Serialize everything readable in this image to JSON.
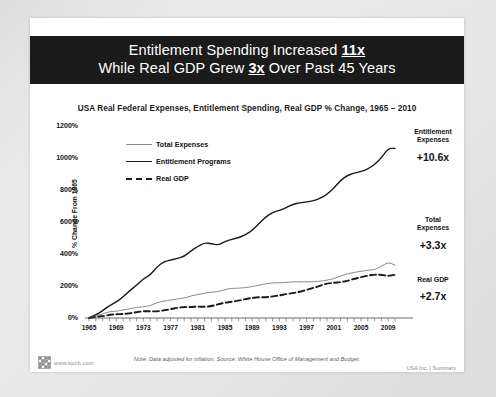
{
  "slide": {
    "title_line1_pre": "Entitlement Spending Increased ",
    "title_line1_emph": "11x",
    "title_line2_pre": "While Real GDP Grew ",
    "title_line2_emph": "3x",
    "title_line2_post": " Over Past 45 Years",
    "subtitle": "USA Real Federal Expenses, Entitlement Spending, Real GDP % Change, 1965 – 2010"
  },
  "footer": {
    "url": "www.kpcb.com",
    "note": "Note: Data adjusted for inflation.  Source: White House Office of Management and Budget.",
    "meta": "USA Inc. | Summary"
  },
  "annotations": [
    {
      "name_line1": "Entitlement",
      "name_line2": "Expenses",
      "value": "+10.6x"
    },
    {
      "name_line1": "Total",
      "name_line2": "Expenses",
      "value": "+3.3x"
    },
    {
      "name_line1": "Real GDP",
      "name_line2": "",
      "value": "+2.7x"
    }
  ],
  "chart_data": {
    "type": "line",
    "title": "USA Real Federal Expenses, Entitlement Spending, Real GDP % Change, 1965 – 2010",
    "xlabel": "",
    "ylabel": "% Change From 1965",
    "xlim": [
      1965,
      2010
    ],
    "ylim": [
      0,
      1200
    ],
    "ytick_labels": [
      "0%",
      "200%",
      "400%",
      "600%",
      "800%",
      "1000%",
      "1200%"
    ],
    "ytick_values": [
      0,
      200,
      400,
      600,
      800,
      1000,
      1200
    ],
    "xtick_labels": [
      "1965",
      "1969",
      "1973",
      "1977",
      "1981",
      "1985",
      "1989",
      "1993",
      "1997",
      "2001",
      "2005",
      "2009"
    ],
    "xtick_values": [
      1965,
      1969,
      1973,
      1977,
      1981,
      1985,
      1989,
      1993,
      1997,
      2001,
      2005,
      2009
    ],
    "grid": false,
    "legend_position": "upper-left-inside",
    "x": [
      1965,
      1966,
      1967,
      1968,
      1969,
      1970,
      1971,
      1972,
      1973,
      1974,
      1975,
      1976,
      1977,
      1978,
      1979,
      1980,
      1981,
      1982,
      1983,
      1984,
      1985,
      1986,
      1987,
      1988,
      1989,
      1990,
      1991,
      1992,
      1993,
      1994,
      1995,
      1996,
      1997,
      1998,
      1999,
      2000,
      2001,
      2002,
      2003,
      2004,
      2005,
      2006,
      2007,
      2008,
      2009,
      2010
    ],
    "series": [
      {
        "name": "Entitlement Programs",
        "style": "solid-thick",
        "color": "#1a1a1a",
        "end_label": "+10.6x",
        "values": [
          0,
          18,
          45,
          78,
          100,
          130,
          172,
          205,
          245,
          268,
          320,
          352,
          362,
          372,
          385,
          420,
          448,
          470,
          465,
          455,
          478,
          492,
          502,
          520,
          548,
          590,
          632,
          660,
          672,
          690,
          712,
          720,
          726,
          732,
          748,
          772,
          812,
          860,
          892,
          905,
          915,
          930,
          960,
          1000,
          1060,
          1060
        ]
      },
      {
        "name": "Total Expenses",
        "style": "solid-thin",
        "color": "#8a8a8a",
        "end_label": "+3.3x",
        "values": [
          0,
          10,
          26,
          40,
          42,
          50,
          58,
          66,
          70,
          76,
          96,
          106,
          112,
          120,
          124,
          138,
          146,
          155,
          162,
          165,
          178,
          186,
          186,
          190,
          196,
          206,
          214,
          220,
          220,
          222,
          226,
          226,
          226,
          226,
          230,
          236,
          246,
          262,
          276,
          285,
          292,
          298,
          302,
          322,
          350,
          330
        ]
      },
      {
        "name": "Real GDP",
        "style": "dashed",
        "color": "#1a1a1a",
        "end_label": "+2.7x",
        "values": [
          0,
          6,
          12,
          19,
          24,
          25,
          29,
          36,
          43,
          42,
          41,
          48,
          55,
          64,
          69,
          68,
          72,
          69,
          74,
          86,
          95,
          102,
          109,
          118,
          126,
          130,
          129,
          135,
          141,
          149,
          156,
          164,
          176,
          188,
          202,
          216,
          220,
          224,
          232,
          245,
          255,
          265,
          272,
          270,
          262,
          270
        ]
      }
    ]
  }
}
